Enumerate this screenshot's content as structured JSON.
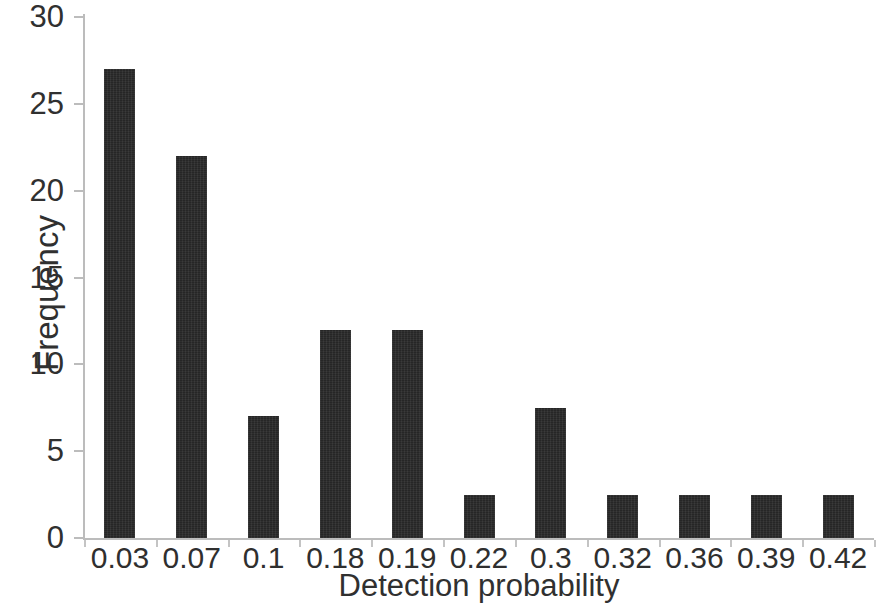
{
  "chart_data": {
    "type": "bar",
    "title": "",
    "subtitle": "",
    "xlabel": "Detection probability",
    "ylabel": "Frequency",
    "categories": [
      "0.03",
      "0.07",
      "0.1",
      "0.18",
      "0.19",
      "0.22",
      "0.3",
      "0.32",
      "0.36",
      "0.39",
      "0.42"
    ],
    "values": [
      27,
      22,
      7,
      12,
      12,
      2.5,
      7.5,
      2.5,
      2.5,
      2.5,
      2.5
    ],
    "series": [
      {
        "name": "Frequency",
        "values": [
          27,
          22,
          7,
          12,
          12,
          2.5,
          7.5,
          2.5,
          2.5,
          2.5,
          2.5
        ]
      }
    ],
    "ylim": [
      0,
      30
    ],
    "yticks": [
      0,
      5,
      10,
      15,
      20,
      25,
      30
    ],
    "ytick_labels": [
      "0",
      "5",
      "10",
      "15",
      "20",
      "25",
      "30"
    ],
    "xtick_labels": [
      "0.03",
      "0.07",
      "0.1",
      "0.18",
      "0.19",
      "0.22",
      "0.3",
      "0.32",
      "0.36",
      "0.39",
      "0.42"
    ],
    "grid": false,
    "legend": false,
    "legend_position": "none",
    "annotations": [],
    "colors": {
      "bar": "#262626",
      "axis": "#bcbcbc",
      "text": "#303030",
      "background": "#ffffff"
    }
  }
}
